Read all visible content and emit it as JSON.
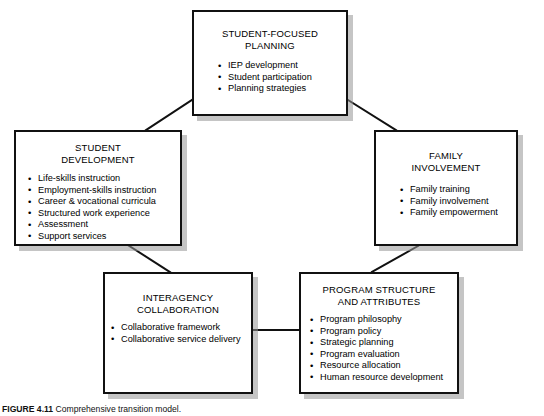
{
  "figure": {
    "label": "FIGURE 4.11",
    "caption": "Comprehensive transition model."
  },
  "diagram": {
    "type": "cycle-model",
    "boxes": [
      {
        "id": "planning",
        "title": "STUDENT-FOCUSED\nPLANNING",
        "bullets": [
          "IEP development",
          "Student participation",
          "Planning strategies"
        ]
      },
      {
        "id": "student-development",
        "title": "STUDENT\nDEVELOPMENT",
        "bullets": [
          "Life-skills instruction",
          "Employment-skills instruction",
          "Career & vocational curricula",
          "Structured work experience",
          "Assessment",
          "Support services"
        ]
      },
      {
        "id": "family-involvement",
        "title": "FAMILY\nINVOLVEMENT",
        "bullets": [
          "Family training",
          "Family involvement",
          "Family empowerment"
        ]
      },
      {
        "id": "interagency-collaboration",
        "title": "INTERAGENCY\nCOLLABORATION",
        "bullets": [
          "Collaborative framework",
          "Collaborative service delivery"
        ]
      },
      {
        "id": "program-structure",
        "title": "PROGRAM STRUCTURE\nAND ATTRIBUTES",
        "bullets": [
          "Program philosophy",
          "Program policy",
          "Strategic planning",
          "Program evaluation",
          "Resource allocation",
          "Human resource development"
        ]
      }
    ],
    "connections": [
      {
        "from": "planning",
        "to": "student-development"
      },
      {
        "from": "planning",
        "to": "family-involvement"
      },
      {
        "from": "student-development",
        "to": "interagency-collaboration"
      },
      {
        "from": "family-involvement",
        "to": "program-structure"
      },
      {
        "from": "interagency-collaboration",
        "to": "program-structure"
      }
    ],
    "colors": {
      "background": "#ffffff",
      "border": "#111111",
      "shadow": "#969696",
      "text": "#000000"
    }
  }
}
